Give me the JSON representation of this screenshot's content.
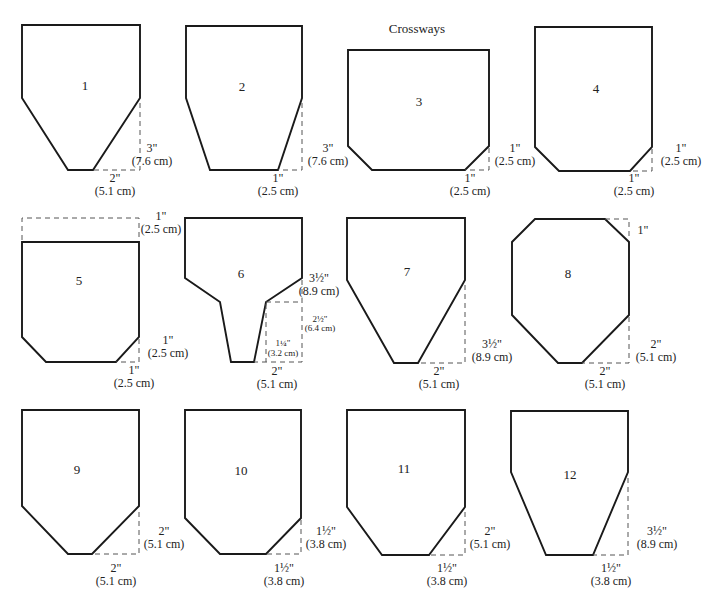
{
  "title": "Crossways",
  "colors": {
    "outline": "#1a1a1a",
    "dash": "#555555",
    "text": "#222222",
    "background": "#ffffff"
  },
  "shapes": [
    {
      "number": "1",
      "labels": [
        {
          "text": "3\"",
          "x": 152,
          "y": 152
        },
        {
          "text": "(7.6 cm)",
          "x": 152,
          "y": 165
        },
        {
          "text": "2\"",
          "x": 115,
          "y": 182
        },
        {
          "text": "(5.1 cm)",
          "x": 115,
          "y": 195
        }
      ]
    },
    {
      "number": "2",
      "labels": [
        {
          "text": "3\"",
          "x": 328,
          "y": 152
        },
        {
          "text": "(7.6 cm)",
          "x": 328,
          "y": 165
        },
        {
          "text": "1\"",
          "x": 278,
          "y": 182
        },
        {
          "text": "(2.5 cm)",
          "x": 278,
          "y": 195
        }
      ]
    },
    {
      "number": "3",
      "labels": [
        {
          "text": "1\"",
          "x": 515,
          "y": 152
        },
        {
          "text": "(2.5 cm)",
          "x": 515,
          "y": 165
        },
        {
          "text": "1\"",
          "x": 470,
          "y": 182
        },
        {
          "text": "(2.5 cm)",
          "x": 470,
          "y": 195
        }
      ]
    },
    {
      "number": "4",
      "labels": [
        {
          "text": "1\"",
          "x": 681,
          "y": 152
        },
        {
          "text": "(2.5 cm)",
          "x": 681,
          "y": 165
        },
        {
          "text": "1\"",
          "x": 634,
          "y": 182
        },
        {
          "text": "(2.5 cm)",
          "x": 634,
          "y": 195
        }
      ]
    },
    {
      "number": "5",
      "labels": [
        {
          "text": "1\"",
          "x": 161,
          "y": 220
        },
        {
          "text": "(2.5 cm)",
          "x": 161,
          "y": 233
        },
        {
          "text": "1\"",
          "x": 168,
          "y": 344
        },
        {
          "text": "(2.5 cm)",
          "x": 168,
          "y": 357
        },
        {
          "text": "1\"",
          "x": 134,
          "y": 374
        },
        {
          "text": "(2.5 cm)",
          "x": 134,
          "y": 387
        }
      ]
    },
    {
      "number": "6",
      "labels": [
        {
          "text": "3½\"",
          "x": 319,
          "y": 282
        },
        {
          "text": "(8.9 cm)",
          "x": 319,
          "y": 295
        },
        {
          "text": "2½\"",
          "x": 320,
          "y": 322,
          "small": true
        },
        {
          "text": "(6.4 cm)",
          "x": 320,
          "y": 331,
          "small": true
        },
        {
          "text": "1¼\"",
          "x": 283,
          "y": 346,
          "small": true
        },
        {
          "text": "(3.2 cm)",
          "x": 283,
          "y": 356,
          "small": true
        },
        {
          "text": "2\"",
          "x": 277,
          "y": 375
        },
        {
          "text": "(5.1 cm)",
          "x": 277,
          "y": 388
        }
      ]
    },
    {
      "number": "7",
      "labels": [
        {
          "text": "3½\"",
          "x": 492,
          "y": 348
        },
        {
          "text": "(8.9 cm)",
          "x": 492,
          "y": 361
        },
        {
          "text": "2\"",
          "x": 439,
          "y": 375
        },
        {
          "text": "(5.1 cm)",
          "x": 439,
          "y": 388
        }
      ]
    },
    {
      "number": "8",
      "labels": [
        {
          "text": "1\"",
          "x": 643,
          "y": 234
        },
        {
          "text": "2\"",
          "x": 656,
          "y": 348
        },
        {
          "text": "(5.1 cm)",
          "x": 656,
          "y": 361
        },
        {
          "text": "2\"",
          "x": 605,
          "y": 375
        },
        {
          "text": "(5.1 cm)",
          "x": 605,
          "y": 388
        }
      ]
    },
    {
      "number": "9",
      "labels": [
        {
          "text": "2\"",
          "x": 164,
          "y": 535
        },
        {
          "text": "(5.1 cm)",
          "x": 164,
          "y": 548
        },
        {
          "text": "2\"",
          "x": 116,
          "y": 572
        },
        {
          "text": "(5.1 cm)",
          "x": 116,
          "y": 585
        }
      ]
    },
    {
      "number": "10",
      "labels": [
        {
          "text": "1½\"",
          "x": 326,
          "y": 535
        },
        {
          "text": "(3.8 cm)",
          "x": 326,
          "y": 548
        },
        {
          "text": "1½\"",
          "x": 284,
          "y": 572
        },
        {
          "text": "(3.8 cm)",
          "x": 284,
          "y": 585
        }
      ]
    },
    {
      "number": "11",
      "labels": [
        {
          "text": "2\"",
          "x": 490,
          "y": 535
        },
        {
          "text": "(5.1 cm)",
          "x": 490,
          "y": 548
        },
        {
          "text": "1½\"",
          "x": 447,
          "y": 572
        },
        {
          "text": "(3.8 cm)",
          "x": 447,
          "y": 585
        }
      ]
    },
    {
      "number": "12",
      "labels": [
        {
          "text": "3½\"",
          "x": 657,
          "y": 535
        },
        {
          "text": "(8.9 cm)",
          "x": 657,
          "y": 548
        },
        {
          "text": "1½\"",
          "x": 611,
          "y": 572
        },
        {
          "text": "(3.8 cm)",
          "x": 611,
          "y": 585
        }
      ]
    }
  ]
}
